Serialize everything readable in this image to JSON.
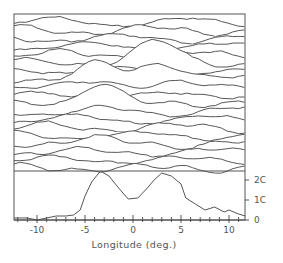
{
  "chart_data": {
    "type": "line",
    "title": "",
    "xlabel": "Longitude (deg.)",
    "ylabel": "",
    "xlim": [
      -12.4,
      11.7
    ],
    "x_ticks": [
      -10,
      -5,
      0,
      5,
      10
    ],
    "x_tick_labels": [
      "-10",
      "-5",
      "0",
      "5",
      "10"
    ],
    "x_minor_tick_step": 1,
    "grid": false,
    "legend": null,
    "panels": [
      {
        "name": "stacked-profiles",
        "type": "line",
        "description": "Waterfall / stacked line traces (hidden-line plot), top to bottom",
        "trace_count": 19,
        "features": [
          {
            "label": "upper peak",
            "x": 2.5,
            "relative_height": "high"
          },
          {
            "label": "middle twin peaks",
            "x": [
              -3.5,
              3.0
            ]
          },
          {
            "label": "lower peak",
            "x": -3.5
          }
        ]
      },
      {
        "name": "integrated-profile",
        "type": "line",
        "ylim": [
          0,
          25
        ],
        "y_ticks": [
          0,
          10,
          20
        ],
        "y_tick_labels": [
          "0",
          "1C",
          "2C"
        ],
        "y_axis_side": "right",
        "series": [
          {
            "name": "profile",
            "x": [
              -12.4,
              -11,
              -10,
              -9,
              -8,
              -7,
              -6.2,
              -5.5,
              -5,
              -4.3,
              -3.4,
              -2.5,
              -1.5,
              -0.5,
              0.5,
              1.5,
              2.2,
              3.0,
              4.0,
              5.0,
              5.5,
              6.5,
              7.5,
              8.5,
              9.5,
              10.0,
              11.0,
              11.7
            ],
            "values": [
              1,
              1,
              0,
              1,
              2,
              2,
              2.5,
              5,
              12,
              19,
              24.5,
              22,
              16,
              10.5,
              11,
              16,
              20,
              23.5,
              22,
              18,
              11,
              8,
              5,
              6.5,
              4,
              5,
              3,
              2
            ]
          }
        ]
      }
    ]
  }
}
